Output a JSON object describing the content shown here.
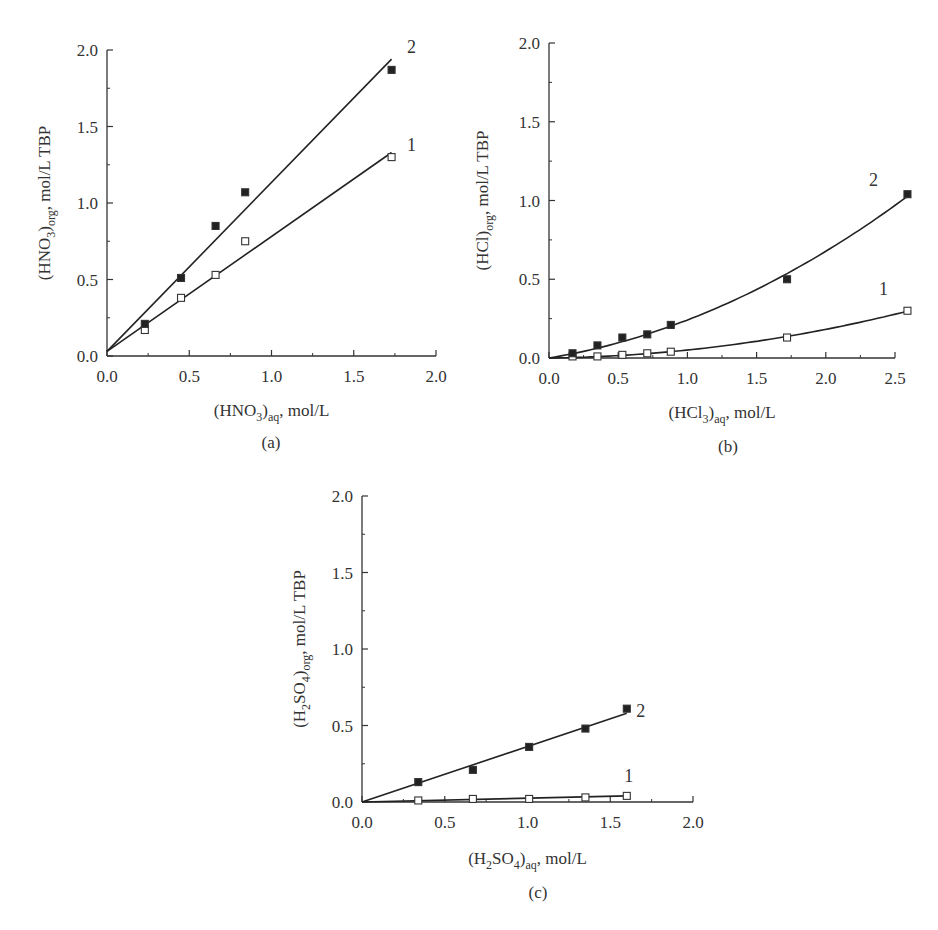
{
  "chart_data": [
    {
      "id": "a",
      "type": "scatter",
      "caption": "(a)",
      "xlabel": "(HNO3)aq, mol/L",
      "xlabel_parts": {
        "pre": "(HNO",
        "sub1": "3",
        "mid": ")",
        "sub2": "aq",
        "post": ", mol/L"
      },
      "ylabel": "(HNO3)org, mol/L TBP",
      "ylabel_parts": {
        "pre": "(HNO",
        "sub1": "3",
        "mid": ")",
        "sub2": "org",
        "post": ", mol/L TBP"
      },
      "xlim": [
        0,
        2.0
      ],
      "ylim": [
        0,
        2.0
      ],
      "xticks": [
        "0.0",
        "0.5",
        "1.0",
        "1.5",
        "2.0"
      ],
      "yticks": [
        "0.0",
        "0.5",
        "1.0",
        "1.5",
        "2.0"
      ],
      "grid": false,
      "legend": "inline curve labels at line ends",
      "series": [
        {
          "name": "1",
          "marker": "open-square",
          "fit": "linear",
          "x": [
            0.23,
            0.45,
            0.66,
            0.84,
            1.73
          ],
          "y": [
            0.17,
            0.38,
            0.53,
            0.75,
            1.3
          ],
          "fit_line": [
            [
              0,
              0.03
            ],
            [
              1.73,
              1.33
            ]
          ]
        },
        {
          "name": "2",
          "marker": "filled-square",
          "fit": "linear",
          "x": [
            0.23,
            0.45,
            0.66,
            0.84,
            1.73
          ],
          "y": [
            0.21,
            0.51,
            0.85,
            1.07,
            1.87
          ],
          "fit_line": [
            [
              0,
              0.03
            ],
            [
              1.73,
              1.94
            ]
          ]
        }
      ]
    },
    {
      "id": "b",
      "type": "scatter",
      "caption": "(b)",
      "xlabel": "(HCl3)aq, mol/L",
      "xlabel_parts": {
        "pre": "(HCl",
        "sub1": "3",
        "mid": ")",
        "sub2": "aq",
        "post": ", mol/L"
      },
      "ylabel": "(HCl)org, mol/L TBP",
      "ylabel_parts": {
        "pre": "(HCl)",
        "sub1": "",
        "mid": "",
        "sub2": "org",
        "post": ", mol/L TBP"
      },
      "xlim": [
        0,
        2.5
      ],
      "ylim": [
        0,
        2.0
      ],
      "xticks": [
        "0.0",
        "0.5",
        "1.0",
        "1.5",
        "2.0",
        "2.5"
      ],
      "yticks": [
        "0.0",
        "0.5",
        "1.0",
        "1.5",
        "2.0"
      ],
      "grid": false,
      "legend": "inline curve labels at line ends",
      "series": [
        {
          "name": "1",
          "marker": "open-square",
          "fit": "curve",
          "x": [
            0.17,
            0.35,
            0.53,
            0.71,
            0.88,
            1.72,
            2.59
          ],
          "y": [
            0.01,
            0.01,
            0.02,
            0.03,
            0.04,
            0.13,
            0.3
          ]
        },
        {
          "name": "2",
          "marker": "filled-square",
          "fit": "curve",
          "x": [
            0.17,
            0.35,
            0.53,
            0.71,
            0.88,
            1.72,
            2.59
          ],
          "y": [
            0.03,
            0.08,
            0.13,
            0.15,
            0.21,
            0.5,
            1.04
          ]
        }
      ]
    },
    {
      "id": "c",
      "type": "scatter",
      "caption": "(c)",
      "xlabel": "(H2SO4)aq, mol/L",
      "xlabel_parts": {
        "pre": "(H",
        "sub0": "2",
        "mid0": "SO",
        "sub1": "4",
        "mid": ")",
        "sub2": "aq",
        "post": ", mol/L"
      },
      "ylabel": "(H2SO4)org, mol/L TBP",
      "ylabel_parts": {
        "pre": "(H",
        "sub0": "2",
        "mid0": "SO",
        "sub1": "4",
        "mid": ")",
        "sub2": "org",
        "post": ", mol/L TBP"
      },
      "xlim": [
        0,
        2.0
      ],
      "ylim": [
        0,
        2.0
      ],
      "xticks": [
        "0.0",
        "0.5",
        "1.0",
        "1.5",
        "2.0"
      ],
      "yticks": [
        "0.0",
        "0.5",
        "1.0",
        "1.5",
        "2.0"
      ],
      "grid": false,
      "legend": "inline curve labels at line ends",
      "series": [
        {
          "name": "1",
          "marker": "open-square",
          "fit": "linear",
          "x": [
            0.34,
            0.67,
            1.01,
            1.35,
            1.6
          ],
          "y": [
            0.01,
            0.02,
            0.02,
            0.03,
            0.04
          ],
          "fit_line": [
            [
              0,
              0.0
            ],
            [
              1.6,
              0.04
            ]
          ]
        },
        {
          "name": "2",
          "marker": "filled-square",
          "fit": "linear",
          "x": [
            0.34,
            0.67,
            1.01,
            1.35,
            1.6
          ],
          "y": [
            0.13,
            0.21,
            0.36,
            0.48,
            0.61
          ],
          "fit_line": [
            [
              0,
              0.0
            ],
            [
              1.6,
              0.58
            ]
          ]
        }
      ]
    }
  ],
  "panels": {
    "a": {
      "caption": "(a)",
      "curve_labels": [
        "1",
        "2"
      ]
    },
    "b": {
      "caption": "(b)",
      "curve_labels": [
        "1",
        "2"
      ]
    },
    "c": {
      "caption": "(c)",
      "curve_labels": [
        "1",
        "2"
      ]
    }
  }
}
